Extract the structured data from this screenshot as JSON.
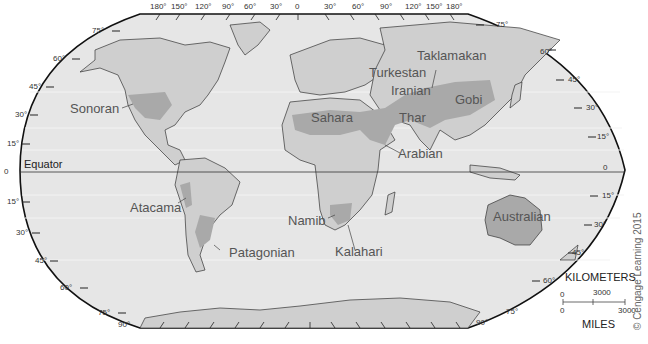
{
  "map": {
    "title": "World Deserts",
    "equator_label": "Equator",
    "deserts": [
      {
        "name": "Sonoran"
      },
      {
        "name": "Atacama"
      },
      {
        "name": "Patagonian"
      },
      {
        "name": "Sahara"
      },
      {
        "name": "Namib"
      },
      {
        "name": "Kalahari"
      },
      {
        "name": "Arabian"
      },
      {
        "name": "Thar"
      },
      {
        "name": "Iranian"
      },
      {
        "name": "Turkestan"
      },
      {
        "name": "Taklamakan"
      },
      {
        "name": "Gobi"
      },
      {
        "name": "Australian"
      }
    ],
    "longitude_labels": [
      "180°",
      "150°",
      "120°",
      "90°",
      "60°",
      "30°",
      "0",
      "30°",
      "60°",
      "90°",
      "120°",
      "150°",
      "180°"
    ],
    "latitude_labels_left": [
      "75°",
      "60°",
      "45°",
      "30°",
      "15°",
      "0",
      "15°",
      "30°",
      "45°",
      "60°",
      "75°",
      "90°"
    ],
    "latitude_labels_right": [
      "75°",
      "60°",
      "45°",
      "30°",
      "15°",
      "0",
      "15°",
      "30°",
      "45°",
      "60°",
      "75°",
      "90°"
    ],
    "scale": {
      "km_label": "KILOMETERS",
      "km_zero": "0",
      "km_max": "3000",
      "mi_label": "MILES",
      "mi_zero": "0",
      "mi_max": "3000"
    },
    "copyright": "© Cengage Learning 2015",
    "colors": {
      "ocean": "#e6e6e6",
      "land": "#cfcfcf",
      "desert": "#a9a9a9",
      "border": "#333333"
    }
  }
}
